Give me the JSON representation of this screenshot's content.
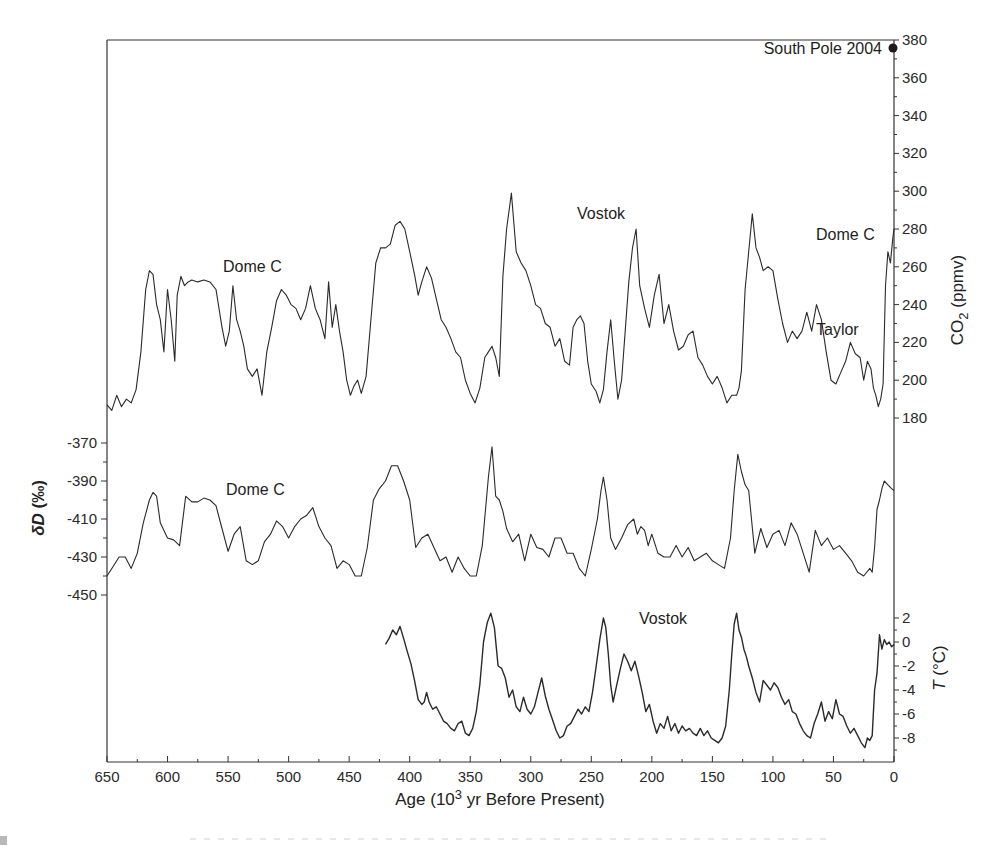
{
  "figure": {
    "x_axis": {
      "label_prefix": "Age (10",
      "label_sup": "3",
      "label_suffix": " yr Before Present)",
      "ticks": [
        650,
        600,
        550,
        500,
        450,
        400,
        350,
        300,
        250,
        200,
        150,
        100,
        50,
        0
      ],
      "range": [
        650,
        0
      ]
    },
    "co2_axis": {
      "label_main": "CO",
      "label_sub": "2",
      "label_units": " (ppmv)",
      "ticks": [
        380,
        360,
        340,
        320,
        300,
        280,
        260,
        240,
        220,
        200,
        180
      ],
      "side": "right"
    },
    "dd_axis": {
      "label_symbol": "δD",
      "label_units": " (‰)",
      "ticks": [
        -370,
        -390,
        -410,
        -430,
        -450
      ],
      "side": "left"
    },
    "t_axis": {
      "label_symbol": "T",
      "label_units": " (°C)",
      "ticks": [
        2,
        0,
        -2,
        -4,
        -6,
        -8
      ],
      "side": "right"
    },
    "annotations": {
      "south_pole": "South Pole 2004",
      "co2_dome_c_left": "Dome C",
      "co2_vostok": "Vostok",
      "co2_dome_c_right": "Dome C",
      "co2_taylor": "Taylor",
      "dd_dome_c": "Dome C",
      "t_vostok": "Vostok"
    },
    "colors": {
      "line": "#2a2a2a",
      "frame": "#333333",
      "background": "#ffffff"
    }
  },
  "chart_data": [
    {
      "type": "line",
      "title": "",
      "name": "CO2 (Dome C / Vostok / Taylor)",
      "xlabel": "Age (10^3 yr Before Present)",
      "ylabel": "CO2 (ppmv)",
      "xlim": [
        650,
        0
      ],
      "ylim": [
        170,
        380
      ],
      "grid": false,
      "x": [
        650,
        646,
        642,
        638,
        634,
        630,
        626,
        622,
        618,
        615,
        612,
        609,
        606,
        603,
        600,
        597,
        594,
        592,
        589,
        586,
        583,
        580,
        575,
        570,
        565,
        560,
        555,
        552,
        549,
        546,
        543,
        540,
        537,
        534,
        530,
        526,
        522,
        518,
        514,
        510,
        506,
        502,
        498,
        494,
        490,
        486,
        482,
        478,
        474,
        470,
        467,
        464,
        461,
        458,
        455,
        452,
        449,
        446,
        443,
        440,
        436,
        432,
        428,
        424,
        420,
        416,
        412,
        408,
        404,
        400,
        396,
        393,
        390,
        386,
        382,
        378,
        374,
        370,
        366,
        362,
        358,
        354,
        350,
        346,
        342,
        338,
        335,
        332,
        329,
        326,
        323,
        320,
        316,
        312,
        308,
        304,
        300,
        296,
        292,
        288,
        284,
        280,
        276,
        272,
        268,
        265,
        262,
        259,
        256,
        253,
        250,
        246,
        243,
        240,
        237,
        234,
        231,
        228,
        225,
        222,
        219,
        216,
        213,
        210,
        206,
        202,
        198,
        194,
        190,
        186,
        182,
        178,
        174,
        170,
        166,
        162,
        158,
        154,
        150,
        146,
        142,
        138,
        134,
        130,
        128,
        126,
        123,
        120,
        117,
        114,
        111,
        108,
        104,
        100,
        96,
        92,
        88,
        84,
        80,
        76,
        72,
        68,
        64,
        60,
        56,
        52,
        48,
        44,
        40,
        36,
        32,
        28,
        25,
        22,
        19,
        17,
        15,
        13,
        11,
        9,
        7,
        5,
        3,
        1,
        0
      ],
      "values": [
        187,
        184,
        192,
        186,
        190,
        188,
        195,
        215,
        248,
        258,
        256,
        240,
        232,
        215,
        248,
        232,
        210,
        245,
        255,
        250,
        252,
        253,
        252,
        253,
        252,
        248,
        228,
        218,
        226,
        250,
        232,
        226,
        218,
        206,
        202,
        206,
        192,
        215,
        228,
        242,
        248,
        245,
        240,
        238,
        232,
        238,
        250,
        238,
        232,
        222,
        252,
        228,
        240,
        226,
        215,
        200,
        192,
        197,
        200,
        193,
        202,
        232,
        262,
        270,
        270,
        272,
        282,
        284,
        280,
        268,
        256,
        245,
        252,
        260,
        254,
        243,
        232,
        228,
        222,
        215,
        212,
        200,
        193,
        188,
        196,
        212,
        215,
        218,
        212,
        202,
        255,
        280,
        299,
        268,
        262,
        258,
        250,
        240,
        238,
        230,
        228,
        218,
        222,
        210,
        208,
        228,
        232,
        234,
        230,
        210,
        198,
        194,
        188,
        195,
        215,
        232,
        210,
        190,
        200,
        226,
        252,
        270,
        280,
        250,
        238,
        228,
        245,
        256,
        230,
        240,
        226,
        216,
        218,
        224,
        226,
        212,
        208,
        202,
        198,
        202,
        196,
        188,
        192,
        192,
        196,
        205,
        248,
        268,
        288,
        270,
        265,
        258,
        260,
        258,
        243,
        230,
        220,
        226,
        222,
        226,
        236,
        226,
        240,
        232,
        215,
        200,
        198,
        204,
        210,
        220,
        214,
        212,
        200,
        210,
        206,
        196,
        192,
        186,
        190,
        198,
        250,
        268,
        262,
        275,
        280
      ]
    },
    {
      "type": "line",
      "name": "δD (Dome C)",
      "ylabel": "δD (‰)",
      "xlim": [
        650,
        0
      ],
      "ylim": [
        -455,
        -365
      ],
      "grid": false,
      "x": [
        650,
        645,
        640,
        635,
        630,
        625,
        620,
        615,
        612,
        609,
        606,
        600,
        595,
        590,
        585,
        580,
        575,
        570,
        565,
        560,
        555,
        550,
        545,
        540,
        535,
        530,
        525,
        520,
        515,
        510,
        505,
        500,
        495,
        490,
        485,
        480,
        475,
        470,
        465,
        460,
        455,
        450,
        445,
        440,
        435,
        430,
        425,
        420,
        415,
        410,
        405,
        400,
        395,
        390,
        385,
        380,
        375,
        370,
        365,
        360,
        355,
        350,
        345,
        340,
        335,
        332,
        329,
        326,
        323,
        320,
        315,
        310,
        305,
        300,
        295,
        290,
        285,
        280,
        275,
        270,
        265,
        260,
        255,
        250,
        245,
        242,
        240,
        237,
        234,
        230,
        225,
        220,
        215,
        212,
        209,
        206,
        203,
        200,
        195,
        190,
        185,
        180,
        175,
        170,
        165,
        160,
        155,
        150,
        145,
        140,
        135,
        132,
        129,
        126,
        123,
        120,
        115,
        110,
        105,
        100,
        95,
        90,
        85,
        80,
        75,
        70,
        65,
        60,
        55,
        50,
        45,
        40,
        35,
        30,
        25,
        20,
        18,
        16,
        14,
        12,
        10,
        8,
        5,
        2,
        0
      ],
      "values": [
        -440,
        -435,
        -430,
        -430,
        -436,
        -428,
        -412,
        -400,
        -396,
        -398,
        -412,
        -420,
        -421,
        -424,
        -398,
        -401,
        -401,
        -399,
        -400,
        -403,
        -415,
        -427,
        -418,
        -414,
        -432,
        -434,
        -432,
        -422,
        -418,
        -411,
        -414,
        -420,
        -414,
        -410,
        -408,
        -404,
        -414,
        -420,
        -424,
        -436,
        -432,
        -434,
        -440,
        -440,
        -425,
        -400,
        -394,
        -390,
        -382,
        -382,
        -390,
        -400,
        -425,
        -420,
        -418,
        -425,
        -432,
        -430,
        -438,
        -430,
        -436,
        -440,
        -440,
        -424,
        -388,
        -372,
        -398,
        -400,
        -406,
        -415,
        -422,
        -418,
        -432,
        -418,
        -425,
        -426,
        -430,
        -420,
        -420,
        -428,
        -428,
        -436,
        -440,
        -426,
        -410,
        -395,
        -388,
        -400,
        -420,
        -426,
        -420,
        -413,
        -410,
        -418,
        -414,
        -416,
        -424,
        -418,
        -428,
        -430,
        -430,
        -424,
        -430,
        -425,
        -432,
        -430,
        -428,
        -432,
        -434,
        -436,
        -420,
        -395,
        -376,
        -385,
        -392,
        -395,
        -428,
        -415,
        -425,
        -418,
        -416,
        -424,
        -412,
        -418,
        -428,
        -438,
        -416,
        -424,
        -420,
        -426,
        -424,
        -428,
        -432,
        -438,
        -440,
        -436,
        -438,
        -425,
        -405,
        -400,
        -394,
        -390,
        -392,
        -394,
        -395
      ]
    },
    {
      "type": "line",
      "name": "Temperature (Vostok)",
      "ylabel": "T (°C)",
      "xlim": [
        650,
        0
      ],
      "ylim": [
        -9.5,
        3
      ],
      "grid": false,
      "x": [
        420,
        417,
        414,
        411,
        408,
        405,
        402,
        399,
        396,
        393,
        390,
        388,
        386,
        384,
        381,
        378,
        375,
        372,
        369,
        366,
        363,
        360,
        357,
        354,
        351,
        348,
        345,
        342,
        339,
        336,
        333,
        330,
        327,
        324,
        321,
        318,
        315,
        312,
        309,
        306,
        303,
        300,
        297,
        294,
        291,
        288,
        285,
        282,
        279,
        276,
        273,
        270,
        267,
        264,
        261,
        258,
        255,
        252,
        249,
        246,
        243,
        240,
        238,
        236,
        234,
        232,
        229,
        226,
        223,
        220,
        217,
        214,
        211,
        208,
        205,
        202,
        199,
        196,
        193,
        190,
        187,
        184,
        181,
        178,
        175,
        172,
        169,
        166,
        163,
        160,
        157,
        154,
        151,
        148,
        145,
        142,
        139,
        136,
        134,
        132,
        130,
        128,
        126,
        124,
        122,
        120,
        117,
        114,
        111,
        108,
        105,
        102,
        99,
        96,
        93,
        90,
        87,
        84,
        81,
        78,
        75,
        72,
        69,
        66,
        63,
        60,
        57,
        54,
        51,
        48,
        45,
        42,
        39,
        36,
        33,
        30,
        27,
        24,
        22,
        20,
        18,
        16,
        14,
        12,
        10,
        8,
        6,
        4,
        2,
        0
      ],
      "values": [
        -0.2,
        0.3,
        1.0,
        0.6,
        1.3,
        0.3,
        -0.8,
        -1.8,
        -3.2,
        -4.8,
        -5.2,
        -5.0,
        -4.2,
        -5.0,
        -5.6,
        -5.4,
        -6.0,
        -6.6,
        -6.8,
        -7.2,
        -7.4,
        -6.8,
        -6.6,
        -7.6,
        -7.8,
        -7.2,
        -5.8,
        -3.5,
        0,
        1.6,
        2.4,
        1.2,
        -2.0,
        -2.2,
        -3.0,
        -4.6,
        -4.0,
        -5.4,
        -5.8,
        -4.6,
        -5.6,
        -6.0,
        -5.4,
        -4.2,
        -3.0,
        -4.5,
        -5.6,
        -6.5,
        -7.4,
        -8.0,
        -7.8,
        -7.0,
        -6.8,
        -6.2,
        -5.6,
        -6.0,
        -5.4,
        -5.8,
        -4.2,
        -2.0,
        0.2,
        2.0,
        1.2,
        -1.0,
        -3.6,
        -5.0,
        -3.6,
        -2.2,
        -1.0,
        -1.6,
        -2.4,
        -1.6,
        -2.8,
        -4.2,
        -5.8,
        -5.2,
        -6.6,
        -7.6,
        -6.8,
        -7.2,
        -6.2,
        -7.4,
        -6.8,
        -7.6,
        -7.0,
        -7.4,
        -7.2,
        -7.6,
        -7.8,
        -7.2,
        -7.8,
        -7.4,
        -8.0,
        -8.2,
        -8.4,
        -8.0,
        -7.0,
        -4.0,
        -1.0,
        1.5,
        2.4,
        1.0,
        0.4,
        -0.6,
        -1.2,
        -2.0,
        -3.0,
        -4.2,
        -5.0,
        -3.2,
        -3.6,
        -4.0,
        -3.4,
        -3.8,
        -4.6,
        -5.2,
        -4.8,
        -5.8,
        -6.0,
        -6.8,
        -7.4,
        -7.8,
        -8.0,
        -6.8,
        -6.0,
        -5.0,
        -6.6,
        -5.8,
        -6.4,
        -4.8,
        -6.0,
        -6.2,
        -7.0,
        -7.6,
        -7.2,
        -7.8,
        -8.4,
        -8.8,
        -8.0,
        -8.2,
        -7.8,
        -4.0,
        -2.6,
        0.6,
        -0.6,
        0.2,
        -0.2,
        0.0,
        -0.4,
        -0.2
      ]
    }
  ]
}
